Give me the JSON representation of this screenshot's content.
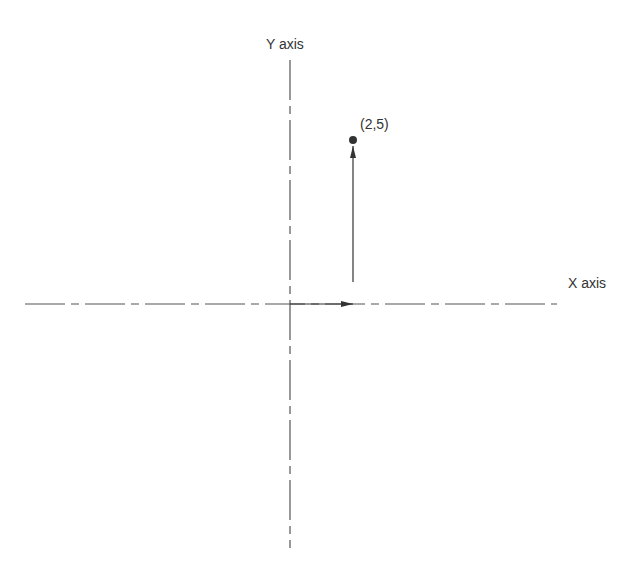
{
  "diagram": {
    "type": "coordinate-plane-vector",
    "x_axis_label": "X axis",
    "y_axis_label": "Y axis",
    "point_label": "(2,5)",
    "point": {
      "x": 2,
      "y": 5
    },
    "origin": {
      "x": 0,
      "y": 0
    },
    "components": [
      {
        "name": "x-component",
        "from": [
          0,
          0
        ],
        "to": [
          2,
          0
        ]
      },
      {
        "name": "y-component",
        "from": [
          2,
          0
        ],
        "to": [
          2,
          5
        ]
      }
    ],
    "line_color": "#444444",
    "axis_style": "dash-dot"
  }
}
